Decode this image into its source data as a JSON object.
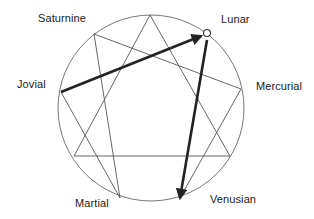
{
  "diagram": {
    "colors": {
      "background": "#ffffff",
      "thin_line": "#555555",
      "circle": "#666666",
      "thick_arrow": "#222222",
      "text": "#1a1a1a",
      "marker_fill": "#ffffff",
      "marker_stroke": "#333333"
    },
    "circle": {
      "cx": 151,
      "cy": 108,
      "r": 93
    },
    "points": {
      "top": {
        "x": 150,
        "y": 15
      },
      "lunar": {
        "x": 207,
        "y": 33
      },
      "mercurial": {
        "x": 241,
        "y": 89
      },
      "lower_right": {
        "x": 230,
        "y": 156
      },
      "venusian": {
        "x": 180,
        "y": 198
      },
      "martial": {
        "x": 120,
        "y": 198
      },
      "lower_left": {
        "x": 74,
        "y": 156
      },
      "jovial": {
        "x": 61,
        "y": 92
      },
      "saturnine": {
        "x": 94,
        "y": 34
      }
    },
    "thin_lines": [
      {
        "name": "triangle-top-to-lower-right",
        "from": "top",
        "to": "lower_right"
      },
      {
        "name": "triangle-lower-right-to-lower-left",
        "from": "lower_right",
        "to": "lower_left"
      },
      {
        "name": "triangle-lower-left-to-top",
        "from": "lower_left",
        "to": "top"
      },
      {
        "name": "hexad-venusian-to-mercurial",
        "from": "venusian",
        "to": "mercurial"
      },
      {
        "name": "hexad-mercurial-to-saturnine",
        "from": "mercurial",
        "to": "saturnine"
      },
      {
        "name": "hexad-saturnine-to-martial",
        "from": "saturnine",
        "to": "martial"
      },
      {
        "name": "hexad-martial-to-jovial",
        "from": "martial",
        "to": "jovial"
      }
    ],
    "thick_arrows": [
      {
        "name": "arrow-jovial-to-lunar",
        "from": "jovial",
        "to": "lunar",
        "end": {
          "x": 201,
          "y": 36
        }
      },
      {
        "name": "arrow-lunar-to-venusian",
        "from": "lunar",
        "to": "venusian",
        "start": {
          "x": 207,
          "y": 40
        }
      }
    ],
    "marker": {
      "point": "lunar",
      "r": 3.5
    },
    "labels": [
      {
        "id": "saturnine",
        "text": "Saturnine",
        "x": 38,
        "y": 12
      },
      {
        "id": "lunar",
        "text": "Lunar",
        "x": 221,
        "y": 13
      },
      {
        "id": "jovial",
        "text": "Jovial",
        "x": 17,
        "y": 78
      },
      {
        "id": "mercurial",
        "text": "Mercurial",
        "x": 256,
        "y": 80
      },
      {
        "id": "martial",
        "text": "Martial",
        "x": 75,
        "y": 197
      },
      {
        "id": "venusian",
        "text": "Venusian",
        "x": 210,
        "y": 193
      }
    ]
  }
}
